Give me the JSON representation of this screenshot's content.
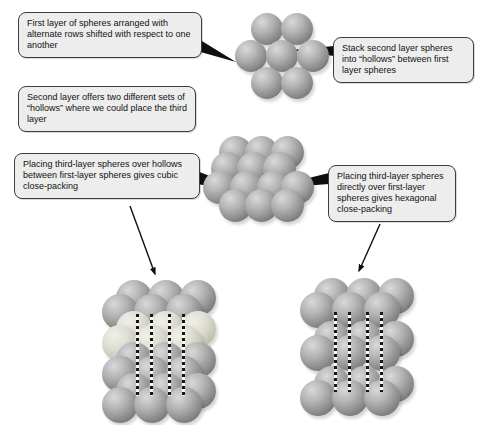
{
  "figure": {
    "callouts": [
      {
        "id": "first-layer",
        "text": "First layer of spheres arranged with alternate rows shifted with respect to one another"
      },
      {
        "id": "second-layer",
        "text": "Stack second layer spheres into “hollows” between first layer spheres"
      },
      {
        "id": "two-hollows",
        "text": "Second layer offers two different sets of “hollows” where we could place the third layer"
      },
      {
        "id": "cubic",
        "text": "Placing third-layer spheres over hollows between first-layer spheres gives cubic close-packing"
      },
      {
        "id": "hexagonal",
        "text": "Placing third-layer spheres directly over first-layer spheres gives hexagonal close-packing"
      }
    ],
    "colors": {
      "sphere_gray": "#a6a6a6",
      "sphere_highlight_layer": "#dedcd0",
      "callout_fill": "#ededed",
      "callout_border": "#3d3d3d",
      "connector_black": "#0f0f0f",
      "background": "#ffffff"
    }
  },
  "illustrations": {
    "clusters": [
      {
        "name": "first-layer-cluster",
        "spheres": [
          [
            267,
            29,
            32,
            0
          ],
          [
            297,
            29,
            32,
            0
          ],
          [
            251,
            56,
            32,
            0
          ],
          [
            282,
            56,
            32,
            0
          ],
          [
            313,
            56,
            32,
            0
          ],
          [
            267,
            83,
            32,
            0
          ],
          [
            297,
            83,
            32,
            0
          ]
        ]
      },
      {
        "name": "two-layer-cluster",
        "spheres": [
          [
            235,
            152,
            33,
            0
          ],
          [
            261,
            152,
            33,
            0
          ],
          [
            287,
            152,
            33,
            0
          ],
          [
            227,
            168,
            33,
            0
          ],
          [
            253,
            168,
            33,
            0
          ],
          [
            279,
            168,
            33,
            0
          ],
          [
            219,
            187,
            33,
            0
          ],
          [
            246,
            187,
            33,
            0
          ],
          [
            273,
            187,
            33,
            0
          ],
          [
            297,
            187,
            33,
            0
          ],
          [
            235,
            205,
            33,
            0
          ],
          [
            261,
            205,
            33,
            0
          ],
          [
            287,
            205,
            33,
            0
          ]
        ]
      },
      {
        "name": "cubic-close-packing-stack",
        "spheres": [
          [
            134,
            298,
            36,
            0
          ],
          [
            166,
            298,
            36,
            0
          ],
          [
            198,
            298,
            36,
            0
          ],
          [
            120,
            312,
            36,
            0
          ],
          [
            152,
            312,
            36,
            0
          ],
          [
            184,
            312,
            36,
            0
          ],
          [
            134,
            329,
            36,
            1
          ],
          [
            166,
            329,
            36,
            1
          ],
          [
            198,
            329,
            36,
            1
          ],
          [
            120,
            343,
            36,
            1
          ],
          [
            152,
            343,
            36,
            1
          ],
          [
            184,
            343,
            36,
            1
          ],
          [
            134,
            360,
            36,
            0
          ],
          [
            166,
            360,
            36,
            0
          ],
          [
            198,
            360,
            36,
            0
          ],
          [
            120,
            374,
            36,
            0
          ],
          [
            152,
            374,
            36,
            0
          ],
          [
            184,
            374,
            36,
            0
          ],
          [
            134,
            391,
            36,
            0
          ],
          [
            166,
            391,
            36,
            0
          ],
          [
            198,
            391,
            36,
            0
          ],
          [
            120,
            405,
            36,
            0
          ],
          [
            152,
            405,
            36,
            0
          ],
          [
            184,
            405,
            36,
            0
          ]
        ],
        "dashes": [
          [
            136,
            314,
            396
          ],
          [
            150,
            314,
            396
          ],
          [
            168,
            314,
            396
          ],
          [
            182,
            314,
            396
          ]
        ]
      },
      {
        "name": "hexagonal-close-packing-stack",
        "spheres": [
          [
            332,
            296,
            36,
            0
          ],
          [
            364,
            296,
            36,
            0
          ],
          [
            396,
            296,
            36,
            0
          ],
          [
            318,
            310,
            36,
            0
          ],
          [
            350,
            310,
            36,
            0
          ],
          [
            382,
            310,
            36,
            0
          ],
          [
            332,
            339,
            36,
            0
          ],
          [
            364,
            339,
            36,
            0
          ],
          [
            396,
            339,
            36,
            0
          ],
          [
            318,
            353,
            36,
            0
          ],
          [
            350,
            353,
            36,
            0
          ],
          [
            382,
            353,
            36,
            0
          ],
          [
            332,
            384,
            36,
            0
          ],
          [
            364,
            384,
            36,
            0
          ],
          [
            396,
            384,
            36,
            0
          ],
          [
            318,
            398,
            36,
            0
          ],
          [
            350,
            398,
            36,
            0
          ],
          [
            382,
            398,
            36,
            0
          ]
        ],
        "dashes": [
          [
            334,
            312,
            392
          ],
          [
            348,
            312,
            392
          ],
          [
            366,
            312,
            392
          ],
          [
            380,
            312,
            392
          ]
        ]
      }
    ]
  }
}
